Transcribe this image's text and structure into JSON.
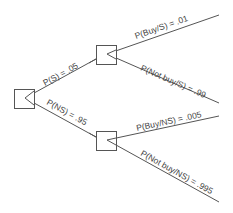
{
  "diagram": {
    "type": "decision-tree",
    "colors": {
      "line": "#555555",
      "text": "#444444",
      "background": "#ffffff"
    },
    "nodes": [
      {
        "id": "root",
        "x": 14,
        "y": 89,
        "w": 20,
        "h": 19,
        "apex": [
          25,
          98
        ]
      },
      {
        "id": "survey",
        "x": 96,
        "y": 45,
        "w": 20,
        "h": 19,
        "apex": [
          107,
          54
        ]
      },
      {
        "id": "no_survey",
        "x": 96,
        "y": 131,
        "w": 20,
        "h": 19,
        "apex": [
          107,
          140
        ]
      }
    ],
    "edges": {
      "p_s": {
        "label": "P(S) = .05"
      },
      "p_ns": {
        "label": "P(NS) = .95"
      },
      "p_buy_s": {
        "label": "P(Buy/S) = .01"
      },
      "p_notbuy_s": {
        "label": "P(Not buy/S) = .99"
      },
      "p_buy_ns": {
        "label": "P(Buy/NS) = .005"
      },
      "p_notbuy_ns": {
        "label": "P(Not buy/NS) = .995"
      }
    }
  }
}
